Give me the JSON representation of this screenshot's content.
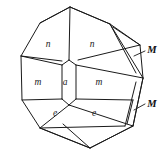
{
  "figure": {
    "background_color": "#ffffff",
    "line_color": "#1a1a1a",
    "stroke_width": 1
  },
  "face_labels": [
    {
      "name": "face-label-n-left",
      "text": "n",
      "x": 48,
      "y": 45
    },
    {
      "name": "face-label-n-right",
      "text": "n",
      "x": 92,
      "y": 45
    },
    {
      "name": "face-label-m-left",
      "text": "m",
      "x": 38,
      "y": 83
    },
    {
      "name": "face-label-a-center",
      "text": "a",
      "x": 65,
      "y": 83
    },
    {
      "name": "face-label-m-right",
      "text": "m",
      "x": 99,
      "y": 83
    },
    {
      "name": "face-label-e-left",
      "text": "e",
      "x": 55,
      "y": 114
    },
    {
      "name": "face-label-e-right",
      "text": "e",
      "x": 94,
      "y": 114
    }
  ],
  "index_labels": [
    {
      "name": "index-label-M-upper",
      "text": "M",
      "x": 152,
      "y": 50
    },
    {
      "name": "index-label-M-lower",
      "text": "M",
      "x": 152,
      "y": 104
    }
  ],
  "leader_lines": [
    {
      "name": "leader-line-M-upper",
      "points": "145,51 134,56"
    },
    {
      "name": "leader-line-M-lower",
      "points": "145,104 134,110"
    }
  ],
  "outline": {
    "name": "crystal-outline",
    "points": "70,7 40,23 21,56 22,100 40,128 90,148 133,126 143,78 140,45 110,24"
  },
  "edges": [
    {
      "name": "edge-top-left-ridge",
      "points": "70,7 40,23"
    },
    {
      "name": "edge-top-right-ridge",
      "points": "70,7 110,24"
    },
    {
      "name": "edge-top-vertical",
      "points": "70,7 69,60"
    },
    {
      "name": "edge-n-left-lower",
      "points": "21,56 62,61"
    },
    {
      "name": "edge-n-right-lower",
      "points": "78,60 140,45"
    },
    {
      "name": "edge-a-upper-left",
      "points": "69,60 62,65"
    },
    {
      "name": "edge-a-upper-right",
      "points": "69,60 76,65"
    },
    {
      "name": "edge-a-left-side",
      "points": "62,65 62,99"
    },
    {
      "name": "edge-a-right-side",
      "points": "76,65 76,99"
    },
    {
      "name": "edge-a-lower-left",
      "points": "62,99 69,105"
    },
    {
      "name": "edge-a-lower-right",
      "points": "76,99 69,105"
    },
    {
      "name": "edge-m-left-upper",
      "points": "21,56 62,65"
    },
    {
      "name": "edge-m-left-lower",
      "points": "22,100 62,99"
    },
    {
      "name": "edge-m-right-upper",
      "points": "76,65 143,78"
    },
    {
      "name": "edge-m-right-lower",
      "points": "76,99 133,100"
    },
    {
      "name": "edge-e-left-lower",
      "points": "40,128 69,105"
    },
    {
      "name": "edge-e-right-lower",
      "points": "69,105 133,126"
    },
    {
      "name": "edge-e-bottom-band",
      "points": "40,128 125,126"
    },
    {
      "name": "edge-bottom-left",
      "points": "40,128 90,148"
    },
    {
      "name": "edge-bottom-right",
      "points": "90,148 133,126"
    },
    {
      "name": "edge-bottom-apex-left",
      "points": "90,148 63,124"
    },
    {
      "name": "edge-right-M-upper-a",
      "points": "110,24 143,78"
    },
    {
      "name": "edge-right-M-upper-b",
      "points": "110,24 136,73"
    },
    {
      "name": "edge-right-M-upper-c",
      "points": "113,27 140,45"
    },
    {
      "name": "edge-right-M-lower-a",
      "points": "143,78 133,126"
    },
    {
      "name": "edge-right-M-lower-b",
      "points": "136,82 125,126"
    },
    {
      "name": "edge-right-M-lower-c",
      "points": "133,100 127,124"
    }
  ]
}
